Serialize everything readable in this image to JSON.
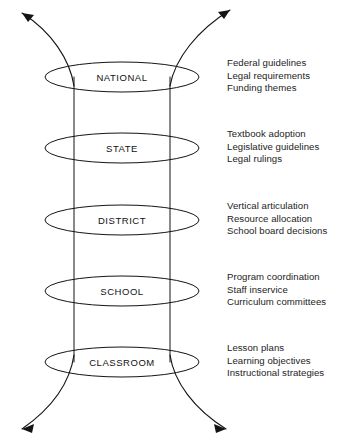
{
  "diagram": {
    "background_color": "#ffffff",
    "line_color": "#141414",
    "text_color": "#242424",
    "levels": [
      {
        "label": "NATIONAL",
        "annotations": [
          "Federal guidelines",
          "Legal requirements",
          "Funding themes"
        ]
      },
      {
        "label": "STATE",
        "annotations": [
          "Textbook adoption",
          "Legislative guidelines",
          "Legal rulings"
        ]
      },
      {
        "label": "DISTRICT",
        "annotations": [
          "Vertical articulation",
          "Resource allocation",
          "School board decisions"
        ]
      },
      {
        "label": "SCHOOL",
        "annotations": [
          "Program coordination",
          "Staff inservice",
          "Curriculum committees"
        ]
      },
      {
        "label": "CLASSROOM",
        "annotations": [
          "Lesson plans",
          "Learning objectives",
          "Instructional strategies"
        ]
      }
    ],
    "arrows": [
      {
        "name": "top-left-outflow-arrow"
      },
      {
        "name": "top-right-outflow-arrow"
      },
      {
        "name": "bottom-left-outflow-arrow"
      },
      {
        "name": "bottom-right-outflow-arrow"
      }
    ]
  }
}
